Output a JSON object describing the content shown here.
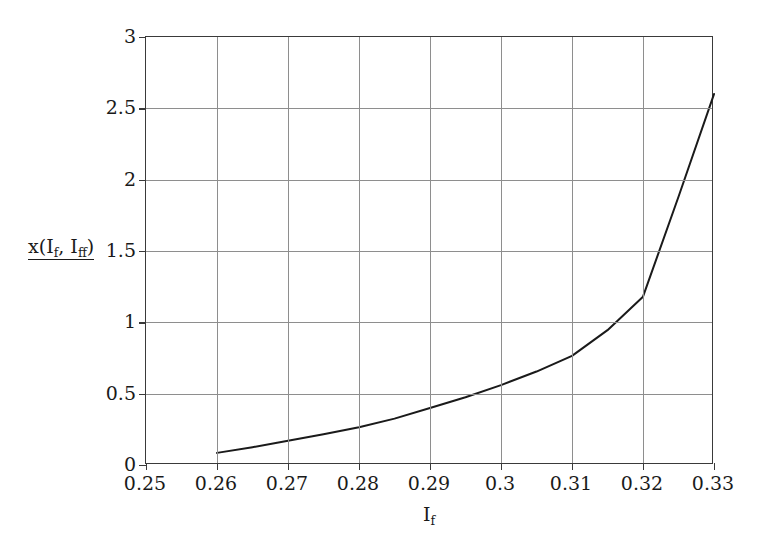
{
  "chart_data": {
    "type": "line",
    "title": "",
    "subtitle": "",
    "xlabel_plain": "I_f",
    "ylabel_plain": "x(I_f, I_ff)",
    "xlim": [
      0.25,
      0.33
    ],
    "ylim": [
      0,
      3
    ],
    "grid": true,
    "legend": null,
    "xticks": [
      0.25,
      0.26,
      0.27,
      0.28,
      0.29,
      0.3,
      0.31,
      0.32,
      0.33
    ],
    "xtick_labels": [
      "0.25",
      "0.26",
      "0.27",
      "0.28",
      "0.29",
      "0.3",
      "0.31",
      "0.32",
      "0.33"
    ],
    "yticks": [
      0,
      0.5,
      1,
      1.5,
      2,
      2.5,
      3
    ],
    "ytick_labels": [
      "0",
      "0.5",
      "1",
      "1.5",
      "2",
      "2.5",
      "3"
    ],
    "series": [
      {
        "name": "x(I_f, I_ff)",
        "color": "#1a1a1a",
        "line_width": 2,
        "x": [
          0.26,
          0.265,
          0.27,
          0.275,
          0.28,
          0.285,
          0.29,
          0.295,
          0.3,
          0.305,
          0.31,
          0.315,
          0.32,
          0.325,
          0.33
        ],
        "values": [
          0.085,
          0.125,
          0.17,
          0.215,
          0.265,
          0.325,
          0.4,
          0.475,
          0.56,
          0.655,
          0.765,
          0.945,
          1.18,
          1.88,
          2.6
        ]
      }
    ],
    "annotations": []
  },
  "axes": {
    "y_label_main": "x(I",
    "y_label_sub1": "f",
    "y_label_mid": ", I",
    "y_label_sub2": "ff",
    "y_label_close": ")",
    "x_label_main": "I",
    "x_label_sub": "f"
  },
  "colors": {
    "background": "#ffffff",
    "frame": "#3a3a3a",
    "gridline": "#8e8e8e",
    "curve": "#1a1a1a",
    "text": "#1a1a1a"
  }
}
